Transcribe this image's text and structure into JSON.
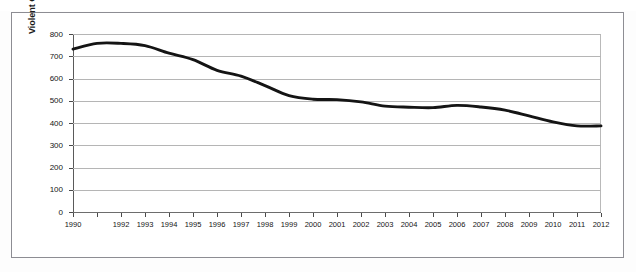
{
  "figure": {
    "top_caption": "",
    "background_color": "#ffffff",
    "frame_color": "#8d8d93",
    "line_color": "#141414",
    "gridline_color": "#b5b5b5"
  },
  "chart_data": {
    "type": "line",
    "title": "",
    "xlabel": "",
    "ylabel": "Violent Crime Rate (per 100,000 residents)",
    "ylim": [
      0,
      800
    ],
    "yticks": [
      0,
      100,
      200,
      300,
      400,
      500,
      600,
      700,
      800
    ],
    "ytick_labels": [
      "0",
      "100",
      "200",
      "300",
      "400",
      "500",
      "600",
      "700",
      "800"
    ],
    "grid": true,
    "legend": false,
    "x": [
      1990,
      1991,
      1992,
      1993,
      1994,
      1995,
      1996,
      1997,
      1998,
      1999,
      2000,
      2001,
      2002,
      2003,
      2004,
      2005,
      2006,
      2007,
      2008,
      2009,
      2010,
      2011,
      2012
    ],
    "xtick_labels": [
      "1990",
      "",
      "1992",
      "1993",
      "1994",
      "1995",
      "1996",
      "1997",
      "1998",
      "1999",
      "2000",
      "2001",
      "2002",
      "2003",
      "2004",
      "2005",
      "2006",
      "2007",
      "2008",
      "2009",
      "2010",
      "2011",
      "2012"
    ],
    "categories": [
      "1990",
      "1991",
      "1992",
      "1993",
      "1994",
      "1995",
      "1996",
      "1997",
      "1998",
      "1999",
      "2000",
      "2001",
      "2002",
      "2003",
      "2004",
      "2005",
      "2006",
      "2007",
      "2008",
      "2009",
      "2010",
      "2011",
      "2012"
    ],
    "values": [
      732,
      758,
      758,
      748,
      714,
      685,
      637,
      611,
      568,
      523,
      507,
      505,
      495,
      476,
      471,
      469,
      479,
      472,
      458,
      432,
      405,
      387,
      387
    ],
    "series": [
      {
        "name": "Violent Crime Rate",
        "color": "#141414",
        "values": [
          732,
          758,
          758,
          748,
          714,
          685,
          637,
          611,
          568,
          523,
          507,
          505,
          495,
          476,
          471,
          469,
          479,
          472,
          458,
          432,
          405,
          387,
          387
        ]
      }
    ]
  }
}
